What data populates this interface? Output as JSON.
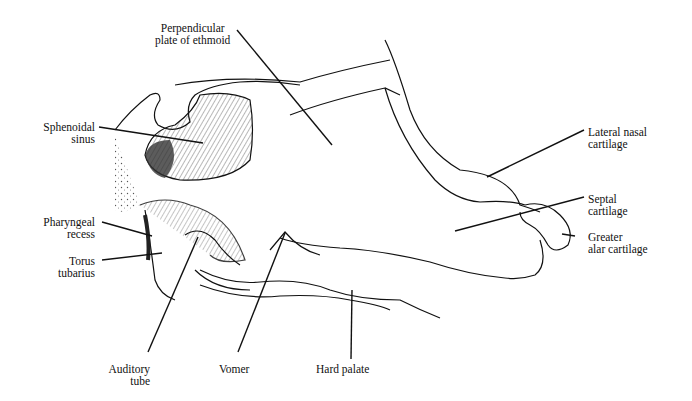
{
  "figure": {
    "labels": [
      {
        "id": "perpendicular-plate",
        "lines": [
          "Perpendicular",
          "plate of ethmoid"
        ]
      },
      {
        "id": "sphenoidal-sinus",
        "lines": [
          "Sphenoidal",
          "sinus"
        ]
      },
      {
        "id": "lateral-nasal-cartilage",
        "lines": [
          "Lateral nasal",
          "cartilage"
        ]
      },
      {
        "id": "septal-cartilage",
        "lines": [
          "Septal",
          "cartilage"
        ]
      },
      {
        "id": "greater-alar-cartilage",
        "lines": [
          "Greater",
          "alar cartilage"
        ]
      },
      {
        "id": "pharyngeal-recess",
        "lines": [
          "Pharyngeal",
          "recess"
        ]
      },
      {
        "id": "torus-tubarius",
        "lines": [
          "Torus",
          "tubarius"
        ]
      },
      {
        "id": "auditory-tube",
        "lines": [
          "Auditory",
          "tube"
        ]
      },
      {
        "id": "vomer",
        "lines": [
          "Vomer"
        ]
      },
      {
        "id": "hard-palate",
        "lines": [
          "Hard palate"
        ]
      }
    ]
  }
}
